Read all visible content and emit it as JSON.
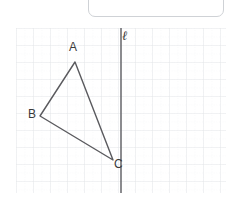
{
  "canvas": {
    "width": 226,
    "height": 206,
    "background": "#ffffff"
  },
  "answer_box": {
    "name": "answer-input-box",
    "value": "",
    "placeholder": "",
    "border_color": "#cfd2d6"
  },
  "graph": {
    "grid": {
      "major_spacing": 17,
      "minor_divisions": 2,
      "major_color": "#e6e8ea",
      "minor_color": "#f1f2f4",
      "show_grid": true
    },
    "line_of_reflection": {
      "label": "ℓ",
      "orientation": "vertical",
      "x": 105,
      "color": "#6f6f73"
    },
    "triangle": {
      "stroke": "#5a5a5e",
      "stroke_width": 1.4,
      "vertices": [
        {
          "label": "A",
          "x": 59,
          "y": 34
        },
        {
          "label": "B",
          "x": 24,
          "y": 88
        },
        {
          "label": "C",
          "x": 97,
          "y": 132
        }
      ]
    }
  }
}
